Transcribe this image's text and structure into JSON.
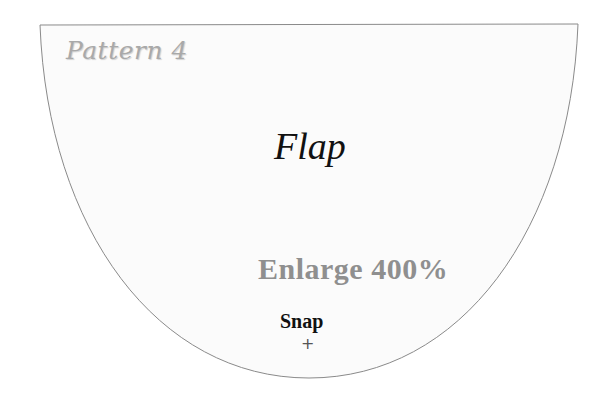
{
  "pattern": {
    "title": "Pattern 4",
    "piece_label": "Flap",
    "instruction": "Enlarge 400%",
    "marker_label": "Snap",
    "marker_symbol": "+"
  },
  "colors": {
    "fill": "#fbfbfb",
    "outline": "#8a8a8a",
    "title": "#a9a9a9",
    "label": "#111111",
    "instruction": "#8f8f8f"
  }
}
